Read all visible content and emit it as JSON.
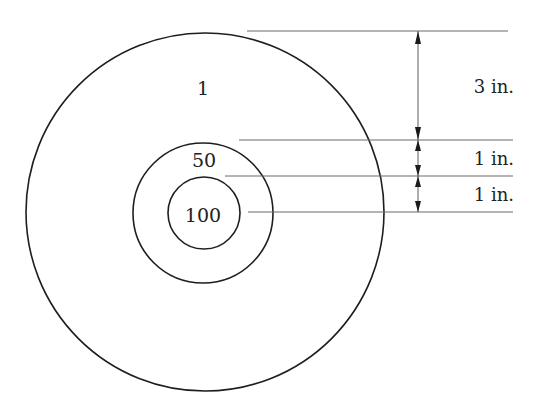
{
  "diagram": {
    "type": "concentric-target-with-dimensions",
    "colors": {
      "ring": "#1e1e1e",
      "extension_line": "#6a6a6a",
      "arrowhead": "#1a1a1a",
      "text": "#222222",
      "background": "#ffffff"
    },
    "rings": [
      {
        "name": "outer",
        "score_label": "1",
        "radius_in": 5
      },
      {
        "name": "middle",
        "score_label": "50",
        "radius_in": 2
      },
      {
        "name": "inner",
        "score_label": "100",
        "radius_in": 1
      }
    ],
    "dimensions": [
      {
        "label": "3 in.",
        "from": "outer-edge",
        "to": "middle-edge"
      },
      {
        "label": "1 in.",
        "from": "middle-edge",
        "to": "inner-edge"
      },
      {
        "label": "1 in.",
        "from": "inner-edge",
        "to": "center"
      }
    ]
  }
}
